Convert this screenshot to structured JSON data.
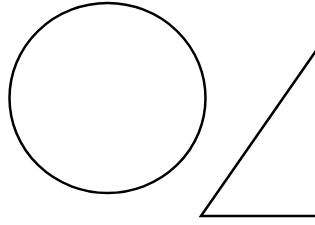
{
  "canvas": {
    "width": 315,
    "height": 225,
    "background": "#ffffff"
  },
  "shapes": [
    {
      "type": "circle",
      "name": "circle",
      "cx": 107.5,
      "cy": 98,
      "rx": 98,
      "ry": 95,
      "stroke": "#000000",
      "stroke_width": 2.5,
      "fill": "none"
    },
    {
      "type": "triangle",
      "name": "triangle",
      "points": "201,216 318,48 330,216",
      "stroke": "#000000",
      "stroke_width": 2.5,
      "fill": "none"
    }
  ]
}
